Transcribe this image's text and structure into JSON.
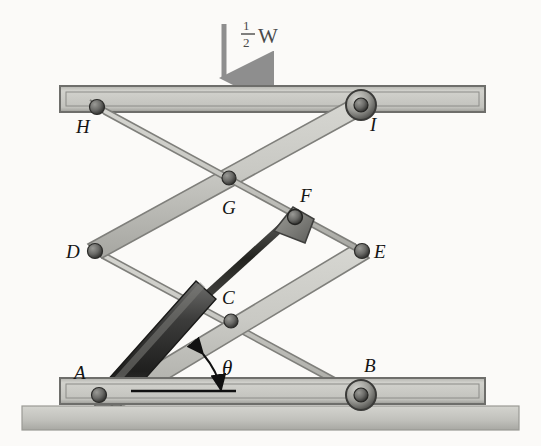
{
  "figure": {
    "background_color": "#fbfaf8"
  },
  "load": {
    "numerator": "1",
    "denominator": "2",
    "symbol": "W",
    "full_label": "1/2 W",
    "arrow_color": "#8e8e8e",
    "arrow_direction": "down"
  },
  "angle": {
    "symbol": "θ",
    "vertex": "A",
    "reference": "horizontal-datum-line"
  },
  "joints": [
    {
      "id": "A",
      "label": "A",
      "x": 99,
      "y": 395,
      "type": "pin",
      "label_x": 76,
      "label_y": 377
    },
    {
      "id": "B",
      "label": "B",
      "x": 361,
      "y": 395,
      "type": "roller",
      "label_x": 366,
      "label_y": 371
    },
    {
      "id": "C",
      "label": "C",
      "x": 231,
      "y": 321,
      "type": "pin",
      "label_x": 222,
      "label_y": 303
    },
    {
      "id": "D",
      "label": "D",
      "x": 95,
      "y": 251,
      "type": "pin",
      "label_x": 66,
      "label_y": 254
    },
    {
      "id": "E",
      "label": "E",
      "x": 362,
      "y": 251,
      "type": "pin",
      "label_x": 372,
      "label_y": 254
    },
    {
      "id": "F",
      "label": "F",
      "x": 292,
      "y": 213,
      "type": "clevis",
      "label_x": 299,
      "label_y": 200
    },
    {
      "id": "G",
      "label": "G",
      "x": 229,
      "y": 178,
      "type": "pin",
      "label_x": 222,
      "label_y": 212
    },
    {
      "id": "H",
      "label": "H",
      "x": 97,
      "y": 107,
      "type": "pin",
      "label_x": 76,
      "label_y": 133
    },
    {
      "id": "I",
      "label": "I",
      "x": 361,
      "y": 105,
      "type": "roller",
      "label_x": 370,
      "label_y": 131
    }
  ],
  "links": [
    {
      "name": "link-H-to-E",
      "from": "H",
      "to": "E"
    },
    {
      "name": "link-D-to-I",
      "from": "D",
      "to": "I"
    },
    {
      "name": "link-A-to-E",
      "from": "A",
      "to": "E"
    },
    {
      "name": "link-D-to-B",
      "from": "D",
      "to": "B"
    }
  ],
  "cylinder": {
    "name": "hydraulic-cylinder",
    "anchor_bottom": "A",
    "anchor_top": "F",
    "barrel_color": "#3a3a3a",
    "rod_color": "#2b2b2b"
  },
  "platform": {
    "name": "top-platform",
    "x": 60,
    "y": 86,
    "width": 425,
    "height": 26,
    "color": "#c9c9c4"
  },
  "base": {
    "name": "bottom-platform",
    "x": 60,
    "y": 378,
    "width": 425,
    "height": 26,
    "color": "#c9c9c4"
  },
  "ground": {
    "name": "ground-slab",
    "x": 22,
    "y": 406,
    "width": 497,
    "height": 24,
    "color": "#bdbdb8"
  },
  "colors": {
    "link_face": "#c6c6c1",
    "link_edge": "#8a8a85",
    "link_shade": "#a9a9a4",
    "pin_dark": "#5a5a58",
    "outline": "#4c4c4a"
  }
}
